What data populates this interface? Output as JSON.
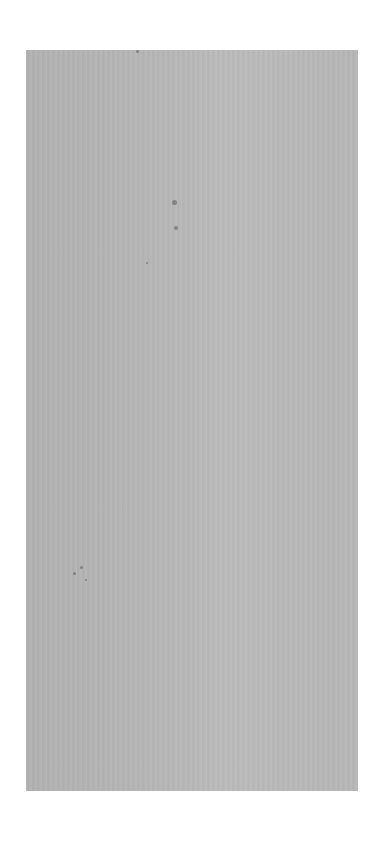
{
  "canvas": {
    "width": 374,
    "height": 852,
    "background": "#ffffff"
  },
  "panel": {
    "color": "#b4b4b4",
    "description": "blank gray textured sheet"
  },
  "specks": [
    {
      "x": 136,
      "y": 50,
      "size": 3
    },
    {
      "x": 172,
      "y": 200,
      "size": 5
    },
    {
      "x": 174,
      "y": 226,
      "size": 4
    },
    {
      "x": 146,
      "y": 262,
      "size": 2
    },
    {
      "x": 73,
      "y": 572,
      "size": 3
    },
    {
      "x": 80,
      "y": 566,
      "size": 3
    },
    {
      "x": 85,
      "y": 579,
      "size": 2
    }
  ]
}
